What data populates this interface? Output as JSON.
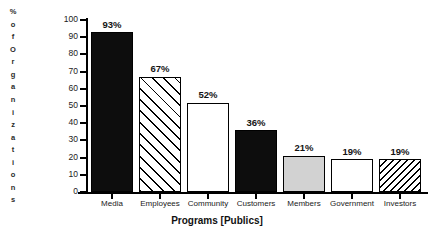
{
  "chart_data": {
    "type": "bar",
    "title": "",
    "xlabel": "Programs [Publics]",
    "ylabel": "% of Organizations",
    "categories": [
      "Media",
      "Employees",
      "Community",
      "Customers",
      "Members",
      "Government",
      "Investors"
    ],
    "values": [
      93,
      67,
      52,
      36,
      21,
      19,
      19
    ],
    "value_labels": [
      "93%",
      "67%",
      "52%",
      "36%",
      "21%",
      "19%",
      "19%"
    ],
    "ylim": [
      0,
      100
    ],
    "ytick_labels": [
      "0",
      "10",
      "20",
      "30",
      "40",
      "50",
      "60",
      "70",
      "80",
      "90",
      "100"
    ],
    "ytick_values": [
      0,
      10,
      20,
      30,
      40,
      50,
      60,
      70,
      80,
      90,
      100
    ],
    "grid": false,
    "legend": "none",
    "bar_fills": [
      "solid-black",
      "diagonal-hatch-forward",
      "white",
      "solid-black",
      "light-gray",
      "white",
      "diagonal-hatch-backward"
    ],
    "colors": {
      "solid": "#0d0d0d",
      "white": "#ffffff",
      "gray": "#d2d2d2",
      "outline": "#000000",
      "text": "#1a1a1a"
    }
  },
  "y_axis_title_chars": [
    "%",
    "o",
    "f",
    "O",
    "r",
    "g",
    "a",
    "n",
    "i",
    "z",
    "a",
    "t",
    "i",
    "o",
    "n",
    "s"
  ]
}
